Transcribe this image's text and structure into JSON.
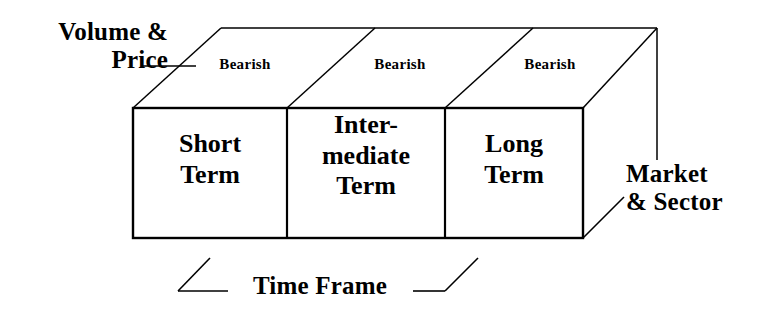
{
  "diagram": {
    "title_text_present": false,
    "callouts": {
      "volume_price": "Volume &\nPrice",
      "market_sector": "Market\n& Sector",
      "time_frame": "Time Frame"
    },
    "top_face_labels": [
      "Bearish",
      "Bearish",
      "Bearish"
    ],
    "front_face_cells": [
      "Short\nTerm",
      "Inter-\nmediate\nTerm",
      "Long\nTerm"
    ],
    "colors": {
      "line": "#000000",
      "text": "#000000",
      "background": "#ffffff"
    }
  }
}
